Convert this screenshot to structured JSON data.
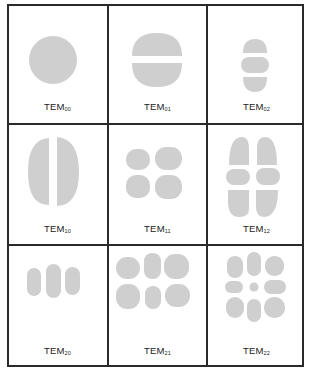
{
  "figure": {
    "shape_color": "#cfcfcf",
    "border_color": "#2a2a2a",
    "modes": [
      {
        "id": "TEM00",
        "base": "TEM",
        "sub": "00",
        "row": 0,
        "col": 0
      },
      {
        "id": "TEM01",
        "base": "TEM",
        "sub": "01",
        "row": 0,
        "col": 1
      },
      {
        "id": "TEM02",
        "base": "TEM",
        "sub": "02",
        "row": 0,
        "col": 2
      },
      {
        "id": "TEM10",
        "base": "TEM",
        "sub": "10",
        "row": 1,
        "col": 0
      },
      {
        "id": "TEM11",
        "base": "TEM",
        "sub": "11",
        "row": 1,
        "col": 1
      },
      {
        "id": "TEM12",
        "base": "TEM",
        "sub": "12",
        "row": 1,
        "col": 2
      },
      {
        "id": "TEM20",
        "base": "TEM",
        "sub": "20",
        "row": 2,
        "col": 0
      },
      {
        "id": "TEM21",
        "base": "TEM",
        "sub": "21",
        "row": 2,
        "col": 1
      },
      {
        "id": "TEM22",
        "base": "TEM",
        "sub": "22",
        "row": 2,
        "col": 2
      }
    ]
  }
}
